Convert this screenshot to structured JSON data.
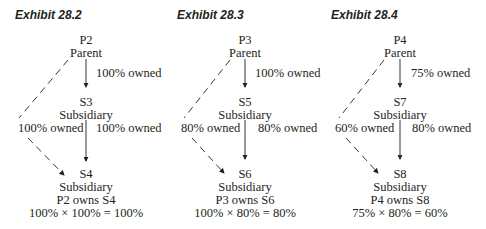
{
  "exhibits": [
    {
      "title": "Exhibit 28.2",
      "parent": {
        "id": "P2",
        "role": "Parent"
      },
      "middle": {
        "id": "S3",
        "role": "Subsidiary"
      },
      "bottom": {
        "id": "S4",
        "role": "Subsidiary",
        "owner_text": "P2 owns S4",
        "calc": "100% × 100% = 100%"
      },
      "parent_to_middle": "100% owned",
      "middle_to_bottom_left": "100% owned",
      "middle_to_bottom_right": "100% owned"
    },
    {
      "title": "Exhibit 28.3",
      "parent": {
        "id": "P3",
        "role": "Parent"
      },
      "middle": {
        "id": "S5",
        "role": "Subsidiary"
      },
      "bottom": {
        "id": "S6",
        "role": "Subsidiary",
        "owner_text": "P3 owns S6",
        "calc": "100% × 80% = 80%"
      },
      "parent_to_middle": "100% owned",
      "middle_to_bottom_left": "80% owned",
      "middle_to_bottom_right": "80% owned"
    },
    {
      "title": "Exhibit 28.4",
      "parent": {
        "id": "P4",
        "role": "Parent"
      },
      "middle": {
        "id": "S7",
        "role": "Subsidiary"
      },
      "bottom": {
        "id": "S8",
        "role": "Subsidiary",
        "owner_text": "P4 owns S8",
        "calc": "75% × 80% = 60%"
      },
      "parent_to_middle": "75% owned",
      "middle_to_bottom_left": "60% owned",
      "middle_to_bottom_right": "80% owned"
    }
  ]
}
